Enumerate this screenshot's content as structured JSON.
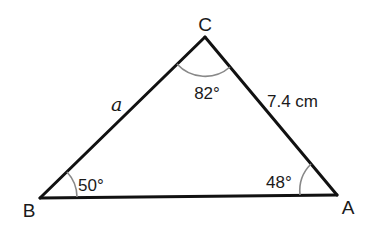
{
  "figure": {
    "type": "triangle",
    "vertices": [
      {
        "id": "B",
        "label": "B",
        "x": 40,
        "y": 198
      },
      {
        "id": "C",
        "label": "C",
        "x": 205,
        "y": 37
      },
      {
        "id": "A",
        "label": "A",
        "x": 337,
        "y": 195
      }
    ],
    "angles": {
      "C": {
        "label": "82°"
      },
      "B": {
        "label": "50°"
      },
      "A": {
        "label": "48°"
      }
    },
    "sides": {
      "BC": {
        "label": "a"
      },
      "CA": {
        "label": "7.4 cm"
      }
    },
    "colors": {
      "line": "#111111",
      "arc": "#888888",
      "text": "#1a1a1a"
    }
  }
}
